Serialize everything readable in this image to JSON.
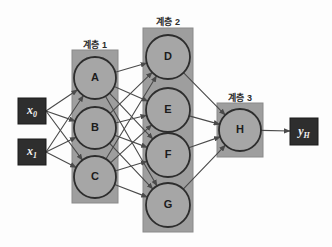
{
  "figure": {
    "background": "#fdfdfd",
    "colors": {
      "layer_box_fill": "#9e9e9e",
      "layer_box_stroke": "#8a8a8a",
      "node_fill": "#a6a6a6",
      "node_stroke": "#2d2d2d",
      "io_box_fill": "#2e2e2e",
      "io_box_stroke": "#1a1a1a",
      "io_text": "#f2f2f2",
      "edge": "#4a4a4a",
      "caption_text": "#2b2b2b"
    }
  },
  "captions": [
    {
      "name": "layer-1-caption",
      "text": "계층 1",
      "x": 72,
      "y": 38,
      "w": 46
    },
    {
      "name": "layer-2-caption",
      "text": "계층 2",
      "x": 143,
      "y": 15,
      "w": 50
    },
    {
      "name": "layer-3-caption",
      "text": "계층 3",
      "x": 217,
      "y": 91,
      "w": 46
    }
  ],
  "layer_boxes": [
    {
      "name": "layer-1-box",
      "x": 72,
      "y": 50,
      "w": 46,
      "h": 153
    },
    {
      "name": "layer-2-box",
      "x": 143,
      "y": 28,
      "w": 50,
      "h": 204
    },
    {
      "name": "layer-3-box",
      "x": 217,
      "y": 103,
      "w": 46,
      "h": 54
    }
  ],
  "inputs": [
    {
      "name": "input-x0",
      "label": "x",
      "sub": "0",
      "x": 18,
      "y": 98,
      "w": 28,
      "h": 26,
      "cx": 46,
      "cy": 111
    },
    {
      "name": "input-x1",
      "label": "x",
      "sub": "1",
      "x": 18,
      "y": 139,
      "w": 28,
      "h": 26,
      "cx": 46,
      "cy": 152
    }
  ],
  "outputs": [
    {
      "name": "output-yh",
      "label": "y",
      "sub": "H",
      "x": 290,
      "y": 118,
      "w": 28,
      "h": 27,
      "cx": 290,
      "cy": 131
    }
  ],
  "nodes": [
    {
      "name": "node-a",
      "label": "A",
      "layer": 1,
      "cx": 95,
      "cy": 78,
      "r": 21
    },
    {
      "name": "node-b",
      "label": "B",
      "layer": 1,
      "cx": 95,
      "cy": 128,
      "r": 21
    },
    {
      "name": "node-c",
      "label": "C",
      "layer": 1,
      "cx": 95,
      "cy": 177,
      "r": 21
    },
    {
      "name": "node-d",
      "label": "D",
      "layer": 2,
      "cx": 168,
      "cy": 57,
      "r": 22
    },
    {
      "name": "node-e",
      "label": "E",
      "layer": 2,
      "cx": 168,
      "cy": 110,
      "r": 22
    },
    {
      "name": "node-f",
      "label": "F",
      "layer": 2,
      "cx": 168,
      "cy": 155,
      "r": 22
    },
    {
      "name": "node-g",
      "label": "G",
      "layer": 2,
      "cx": 168,
      "cy": 205,
      "r": 22
    },
    {
      "name": "node-h",
      "label": "H",
      "layer": 3,
      "cx": 240,
      "cy": 130,
      "r": 21
    }
  ],
  "edges": {
    "input_to_layer1": [
      {
        "from": "x0",
        "to": "A"
      },
      {
        "from": "x0",
        "to": "B"
      },
      {
        "from": "x0",
        "to": "C"
      },
      {
        "from": "x1",
        "to": "A"
      },
      {
        "from": "x1",
        "to": "B"
      },
      {
        "from": "x1",
        "to": "C"
      }
    ],
    "layer1_to_layer2": [
      {
        "from": "A",
        "to": "D"
      },
      {
        "from": "A",
        "to": "E"
      },
      {
        "from": "A",
        "to": "F"
      },
      {
        "from": "A",
        "to": "G"
      },
      {
        "from": "B",
        "to": "D"
      },
      {
        "from": "B",
        "to": "E"
      },
      {
        "from": "B",
        "to": "F"
      },
      {
        "from": "B",
        "to": "G"
      },
      {
        "from": "C",
        "to": "D"
      },
      {
        "from": "C",
        "to": "E"
      },
      {
        "from": "C",
        "to": "F"
      },
      {
        "from": "C",
        "to": "G"
      }
    ],
    "layer2_to_layer3": [
      {
        "from": "D",
        "to": "H"
      },
      {
        "from": "E",
        "to": "H"
      },
      {
        "from": "F",
        "to": "H"
      },
      {
        "from": "G",
        "to": "H"
      }
    ],
    "layer3_to_output": [
      {
        "from": "H",
        "to": "yH"
      }
    ]
  }
}
